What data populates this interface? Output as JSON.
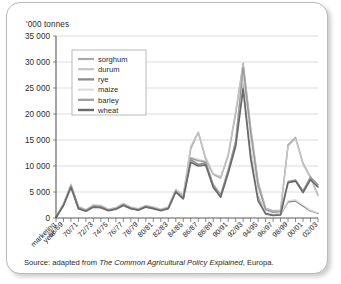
{
  "card": {
    "axis_title": "'000 tonnes",
    "source_prefix": "Source: adapted from ",
    "source_work": "The Common Agricultural Policy Explained",
    "source_suffix": ", Europa."
  },
  "chart_data": {
    "type": "line",
    "title": "",
    "subtitle": "",
    "xlabel": "marketing year",
    "ylabel": "'000 tonnes",
    "ylim": [
      0,
      35000
    ],
    "ytick_labels": [
      "0",
      "5 000",
      "10 000",
      "15 000",
      "20 000",
      "25 000",
      "30 000",
      "35 000"
    ],
    "ytick_values": [
      0,
      5000,
      10000,
      15000,
      20000,
      25000,
      30000,
      35000
    ],
    "grid": true,
    "legend_position": "upper-left-inside",
    "x_axis_corner_label_line1": "marketing",
    "x_axis_corner_label_line2": "year",
    "x": [
      "67/68",
      "68/69",
      "69/70",
      "70/71",
      "71/72",
      "72/73",
      "73/74",
      "74/75",
      "75/76",
      "76/77",
      "77/78",
      "78/79",
      "79/80",
      "80/81",
      "81/82",
      "82/83",
      "83/84",
      "84/85",
      "85/86",
      "86/87",
      "87/88",
      "88/89",
      "89/90",
      "90/91",
      "91/92",
      "92/93",
      "93/94",
      "94/95",
      "95/96",
      "96/97",
      "97/98",
      "98/99",
      "99/00",
      "00/01",
      "01/02",
      "02/03"
    ],
    "xtick_labels": [
      "68/69",
      "70/71",
      "72/73",
      "74/75",
      "76/77",
      "78/79",
      "80/81",
      "82/83",
      "84/85",
      "86/87",
      "88/89",
      "90/91",
      "92/93",
      "94/95",
      "96/97",
      "98/99",
      "00/01",
      "02/03"
    ],
    "series": [
      {
        "name": "sorghum",
        "color": "#a8a8a8",
        "width": 1.5,
        "values": [
          150,
          2600,
          6300,
          2100,
          1500,
          2400,
          2300,
          1600,
          1900,
          2700,
          2000,
          1700,
          2300,
          2000,
          1600,
          2000,
          5400,
          4200,
          13300,
          16500,
          11300,
          8400,
          7700,
          11900,
          20000,
          29800,
          17500,
          7000,
          1900,
          1400,
          1500,
          14100,
          15500,
          10500,
          7900,
          4400
        ]
      },
      {
        "name": "durum",
        "color": "#c4c4c4",
        "width": 1.5,
        "values": [
          200,
          2800,
          6500,
          2200,
          1600,
          2500,
          2400,
          1700,
          2000,
          2800,
          2100,
          1800,
          2400,
          2100,
          1700,
          2100,
          5500,
          4400,
          13700,
          16500,
          11600,
          8500,
          7900,
          12200,
          20500,
          29400,
          17000,
          6700,
          1800,
          1300,
          1400,
          13800,
          15300,
          10300,
          7700,
          4300
        ]
      },
      {
        "name": "rye",
        "color": "#8a8a8a",
        "width": 1.6,
        "values": [
          120,
          2500,
          6100,
          1900,
          1400,
          2200,
          2100,
          1500,
          1800,
          2500,
          1900,
          1600,
          2200,
          1900,
          1500,
          1900,
          5100,
          3800,
          11200,
          10300,
          10600,
          6200,
          4300,
          9000,
          14400,
          26000,
          13000,
          4200,
          900,
          600,
          700,
          3100,
          3300,
          2300,
          1400,
          900
        ]
      },
      {
        "name": "maize",
        "color": "#dcdcdc",
        "width": 1.4,
        "values": [
          170,
          2700,
          6200,
          2000,
          1500,
          2300,
          2200,
          1600,
          1900,
          2600,
          2000,
          1700,
          2300,
          2000,
          1600,
          2000,
          5300,
          4000,
          11700,
          11300,
          10900,
          6600,
          4600,
          9400,
          14900,
          27200,
          13800,
          4600,
          1100,
          700,
          800,
          3300,
          3500,
          2500,
          1500,
          1000
        ]
      },
      {
        "name": "barley",
        "color": "#9c9c9c",
        "width": 1.5,
        "values": [
          140,
          2550,
          6200,
          2000,
          1450,
          2300,
          2200,
          1550,
          1850,
          2600,
          1950,
          1650,
          2250,
          1950,
          1550,
          1950,
          5200,
          3900,
          11500,
          11000,
          10800,
          6400,
          4500,
          9200,
          14700,
          29000,
          16600,
          6200,
          1600,
          1100,
          1200,
          7000,
          7300,
          5200,
          7900,
          6400
        ]
      },
      {
        "name": "wheat",
        "color": "#6b6b6b",
        "width": 1.7,
        "values": [
          100,
          2400,
          5900,
          1800,
          1300,
          2100,
          2000,
          1400,
          1700,
          2400,
          1800,
          1500,
          2100,
          1800,
          1400,
          1800,
          5000,
          3700,
          10700,
          10000,
          10200,
          5900,
          4000,
          8600,
          13800,
          24800,
          11500,
          3300,
          800,
          500,
          600,
          6800,
          7100,
          4900,
          7400,
          6000
        ]
      }
    ]
  }
}
